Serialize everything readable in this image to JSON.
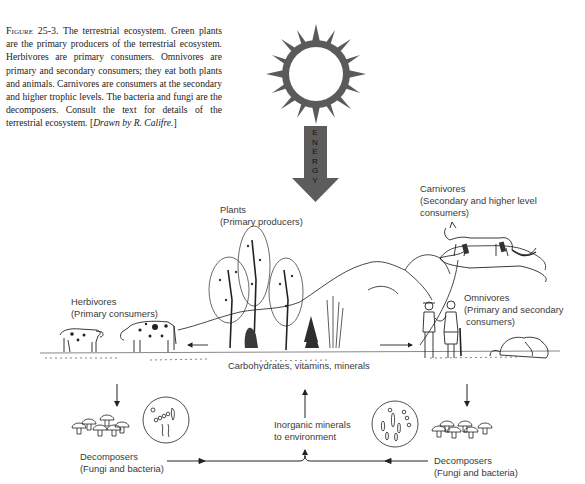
{
  "caption": {
    "figure_label": "Figure 25-3.",
    "text": "The terrestrial ecosystem. Green plants are the primary producers of the terrestrial ecosystem. Herbivores are primary consumers. Omnivores are primary and secondary consumers; they eat both plants and animals. Carnivores are consumers at the secondary and higher trophic levels. The bacteria and fungi are the decomposers. Consult the text for details of the terrestrial ecosystem.",
    "credit_open": "[",
    "credit": "Drawn by R. Califre.",
    "credit_close": "]"
  },
  "energy": {
    "label": "ENERGY"
  },
  "labels": {
    "plants": {
      "title": "Plants",
      "subtitle": "(Primary producers)"
    },
    "carnivores": {
      "title": "Carnivores",
      "subtitle_1": "(Secondary and higher level",
      "subtitle_2": "consumers)"
    },
    "herbivores": {
      "title": "Herbivores",
      "subtitle": "(Primary consumers)"
    },
    "omnivores": {
      "title": "Omnivores",
      "subtitle_1": "(Primary and secondary",
      "subtitle_2": "consumers)"
    },
    "nutrients": "Carbohydrates, vitamins, minerals",
    "inorganic": {
      "line_1": "Inorganic minerals",
      "line_2": "to environment"
    },
    "decomposers_left": {
      "title": "Decomposers",
      "subtitle": "(Fungi and bacteria)"
    },
    "decomposers_right": {
      "title": "Decomposers",
      "subtitle": "(Fungi and bacteria)"
    }
  },
  "colors": {
    "sun": "#5a5a5a",
    "arrow": "#5c5c5c",
    "ink": "#2a2a2a"
  }
}
